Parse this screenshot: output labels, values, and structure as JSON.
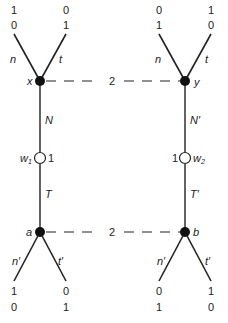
{
  "diagram": {
    "type": "game-tree",
    "nodes": {
      "x": {
        "label": "x",
        "filled": true
      },
      "y": {
        "label": "y",
        "filled": true
      },
      "a": {
        "label": "a",
        "filled": true
      },
      "b": {
        "label": "b",
        "filled": true
      },
      "w1": {
        "label": "w",
        "sub": "1",
        "value": "1",
        "filled": false
      },
      "w2": {
        "label": "w",
        "sub": "2",
        "value": "1",
        "filled": false
      }
    },
    "info_sets": [
      {
        "between": [
          "x",
          "y"
        ],
        "label": "2"
      },
      {
        "between": [
          "a",
          "b"
        ],
        "label": "2"
      }
    ],
    "edges": {
      "x_n": "n",
      "x_t": "t",
      "y_n": "n",
      "y_t": "t",
      "x_w1": "N",
      "w1_a": "T",
      "y_w2": "N′",
      "w2_b": "T′",
      "a_n": "n′",
      "a_t": "t′",
      "b_n": "n′",
      "b_t": "t′"
    },
    "payoffs": {
      "x_n": [
        "1",
        "0"
      ],
      "x_t": [
        "0",
        "1"
      ],
      "y_n": [
        "0",
        "1"
      ],
      "y_t": [
        "1",
        "0"
      ],
      "a_n": [
        "1",
        "0"
      ],
      "a_t": [
        "0",
        "1"
      ],
      "b_n": [
        "0",
        "1"
      ],
      "b_t": [
        "1",
        "0"
      ]
    }
  }
}
